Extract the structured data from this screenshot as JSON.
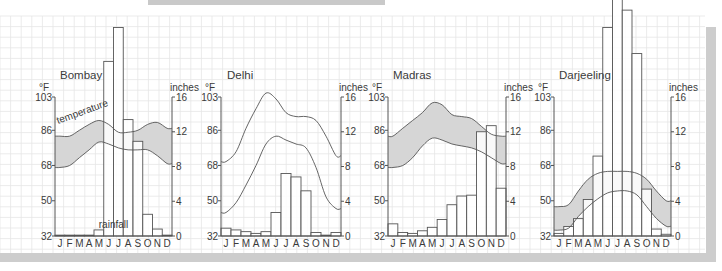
{
  "colors": {
    "grid": "#e6e6e6",
    "axis": "#555555",
    "line": "#555555",
    "band_fill": "#d6d6d6",
    "bar_fill": "#ffffff",
    "text": "#3a3a3a",
    "frame_gray": "#cdcdcd"
  },
  "annotations": {
    "temperature_label": "temperature",
    "rainfall_label": "rainfall"
  },
  "axis_labels": {
    "left_unit": "°F",
    "right_unit": "inches"
  },
  "chart_data": [
    {
      "type": "bar+band",
      "title": "Bombay",
      "categories": [
        "J",
        "F",
        "M",
        "A",
        "M",
        "J",
        "J",
        "A",
        "S",
        "O",
        "N",
        "D"
      ],
      "ylabel_left": "°F",
      "ylabel_right": "inches",
      "yticks_left": [
        32,
        50,
        68,
        86,
        103
      ],
      "yticks_right": [
        0,
        4,
        8,
        12,
        16
      ],
      "ylim_left": [
        32,
        103
      ],
      "ylim_right": [
        0,
        16
      ],
      "band_shaded": true,
      "series": [
        {
          "name": "rainfall (inches)",
          "kind": "bar",
          "values": [
            0.1,
            0.1,
            0.1,
            0.1,
            0.7,
            20.1,
            24.0,
            13.4,
            10.9,
            2.5,
            0.8,
            0.1
          ]
        },
        {
          "name": "temperature max (°F)",
          "kind": "line",
          "values": [
            83,
            83,
            86,
            89,
            91,
            89,
            85,
            85,
            86,
            89,
            90,
            87
          ]
        },
        {
          "name": "temperature min (°F)",
          "kind": "line",
          "values": [
            67,
            68,
            72,
            76,
            80,
            79,
            77,
            76,
            76,
            76,
            73,
            69
          ]
        }
      ]
    },
    {
      "type": "bar+band",
      "title": "Delhi",
      "categories": [
        "J",
        "F",
        "M",
        "A",
        "M",
        "J",
        "J",
        "A",
        "S",
        "O",
        "N",
        "D"
      ],
      "ylabel_left": "°F",
      "ylabel_right": "inches",
      "yticks_left": [
        32,
        50,
        68,
        86,
        103
      ],
      "yticks_right": [
        0,
        4,
        8,
        12,
        16
      ],
      "ylim_left": [
        32,
        103
      ],
      "ylim_right": [
        0,
        16
      ],
      "band_shaded": false,
      "series": [
        {
          "name": "rainfall (inches)",
          "kind": "bar",
          "values": [
            0.9,
            0.7,
            0.5,
            0.3,
            0.5,
            2.7,
            7.2,
            6.8,
            5.2,
            0.4,
            0.1,
            0.4
          ]
        },
        {
          "name": "temperature max (°F)",
          "kind": "line",
          "values": [
            70,
            75,
            87,
            97,
            105,
            102,
            95,
            93,
            93,
            91,
            83,
            73
          ]
        },
        {
          "name": "temperature min (°F)",
          "kind": "line",
          "values": [
            44,
            49,
            58,
            68,
            79,
            83,
            81,
            79,
            77,
            67,
            52,
            46
          ]
        }
      ]
    },
    {
      "type": "bar+band",
      "title": "Madras",
      "categories": [
        "J",
        "F",
        "M",
        "A",
        "M",
        "J",
        "J",
        "A",
        "S",
        "O",
        "N",
        "D"
      ],
      "ylabel_left": "°F",
      "ylabel_right": "inches",
      "yticks_left": [
        32,
        50,
        68,
        86,
        103
      ],
      "yticks_right": [
        0,
        4,
        8,
        12,
        16
      ],
      "ylim_left": [
        32,
        103
      ],
      "ylim_right": [
        0,
        16
      ],
      "band_shaded": true,
      "series": [
        {
          "name": "rainfall (inches)",
          "kind": "bar",
          "values": [
            1.4,
            0.4,
            0.3,
            0.6,
            1.0,
            1.9,
            3.6,
            4.6,
            4.7,
            12.0,
            12.7,
            5.5
          ]
        },
        {
          "name": "temperature max (°F)",
          "kind": "line",
          "values": [
            83,
            87,
            91,
            95,
            100,
            99,
            94,
            93,
            92,
            88,
            84,
            83
          ]
        },
        {
          "name": "temperature min (°F)",
          "kind": "line",
          "values": [
            67,
            68,
            72,
            78,
            82,
            81,
            79,
            78,
            77,
            75,
            72,
            69
          ]
        }
      ]
    },
    {
      "type": "bar+band",
      "title": "Darjeeling",
      "categories": [
        "J",
        "F",
        "M",
        "A",
        "M",
        "J",
        "J",
        "A",
        "S",
        "O",
        "N",
        "D"
      ],
      "ylabel_left": "°F",
      "ylabel_right": "inches",
      "yticks_left": [
        32,
        50,
        68,
        86,
        103
      ],
      "yticks_right": [
        0,
        4,
        8,
        12,
        16
      ],
      "ylim_left": [
        32,
        103
      ],
      "ylim_right": [
        0,
        16
      ],
      "band_shaded": true,
      "series": [
        {
          "name": "rainfall (inches)",
          "kind": "bar",
          "values": [
            0.3,
            1.1,
            2.0,
            4.2,
            9.2,
            24.0,
            32.0,
            26.0,
            21.0,
            5.4,
            0.8,
            0.2
          ]
        },
        {
          "name": "temperature max (°F)",
          "kind": "line",
          "values": [
            47,
            48,
            55,
            61,
            64,
            65,
            65,
            65,
            64,
            61,
            55,
            50
          ]
        },
        {
          "name": "temperature min (°F)",
          "kind": "line",
          "values": [
            35,
            36,
            42,
            47,
            51,
            54,
            55,
            55,
            53,
            47,
            41,
            37
          ]
        }
      ]
    }
  ]
}
